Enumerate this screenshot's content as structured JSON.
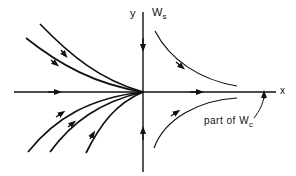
{
  "diagram": {
    "axes": {
      "x_label": "x",
      "y_label": "y"
    },
    "manifolds": {
      "stable_label": "W",
      "stable_sub": "s",
      "center_annotation_prefix": "part of W",
      "center_sub": "c"
    },
    "colors": {
      "stroke": "#111111",
      "background": "#ffffff"
    }
  }
}
